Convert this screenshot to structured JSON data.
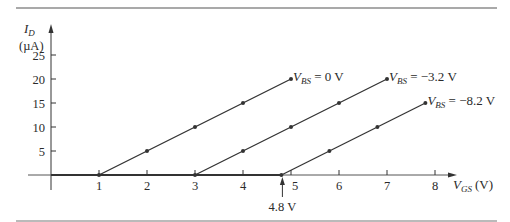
{
  "chart_data": {
    "type": "line",
    "title": "",
    "xlabel": "V_GS (V)",
    "xlabel_main": "V",
    "xlabel_sub": "GS",
    "xlabel_unit": "(V)",
    "ylabel_main": "I",
    "ylabel_sub": "D",
    "ylabel_unit": "(µA)",
    "xlim": [
      0,
      8.4
    ],
    "ylim": [
      0,
      27
    ],
    "x_ticks": [
      "1",
      "2",
      "3",
      "4",
      "5",
      "6",
      "7",
      "8"
    ],
    "y_ticks": [
      "5",
      "10",
      "15",
      "20",
      "25"
    ],
    "grid": false,
    "legend": "inline labels at line ends",
    "series": [
      {
        "name": "V_BS = 0 V",
        "label_main": "V",
        "label_sub": "BS",
        "label_rest": " = 0 V",
        "x": [
          1,
          2,
          3,
          4,
          5
        ],
        "y": [
          0,
          5,
          10,
          15,
          20
        ]
      },
      {
        "name": "V_BS = -3.2 V",
        "label_main": "V",
        "label_sub": "BS",
        "label_rest": " = −3.2 V",
        "x": [
          3,
          4,
          5,
          6,
          7
        ],
        "y": [
          0,
          5,
          10,
          15,
          20
        ]
      },
      {
        "name": "V_BS = -8.2 V",
        "label_main": "V",
        "label_sub": "BS",
        "label_rest": " = −8.2 V",
        "x": [
          4.8,
          5.8,
          6.8,
          7.8
        ],
        "y": [
          0,
          5,
          10,
          15
        ]
      }
    ],
    "annotations": [
      {
        "text": "4.8 V",
        "x": 4.8,
        "y": 0,
        "arrow": "up"
      }
    ]
  }
}
